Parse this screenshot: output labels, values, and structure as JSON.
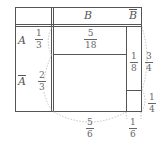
{
  "diagram": {
    "type": "probability-area-table",
    "header": {
      "col_B": "B",
      "col_notB": "B"
    },
    "rows": [
      {
        "label": "A",
        "prob": {
          "num": "1",
          "den": "3"
        }
      },
      {
        "label": "A",
        "prob": {
          "num": "2",
          "den": "3"
        }
      }
    ],
    "cells": {
      "A_and_B": {
        "num": "5",
        "den": "18"
      },
      "notB_upper": {
        "num": "1",
        "den": "8"
      }
    },
    "right_labels": [
      {
        "num": "3",
        "den": "4"
      },
      {
        "num": "1",
        "den": "4"
      }
    ],
    "bottom_labels": [
      {
        "num": "5",
        "den": "6"
      },
      {
        "num": "1",
        "den": "6"
      }
    ],
    "colors": {
      "line": "#555555",
      "text": "#666666",
      "dashed": "#aaaaaa"
    }
  }
}
